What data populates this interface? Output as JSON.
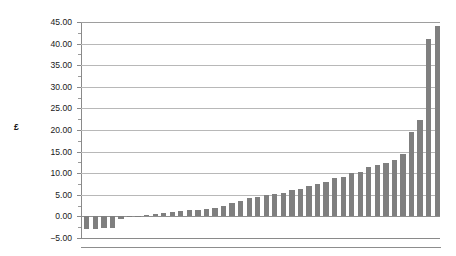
{
  "chart_data": {
    "type": "bar",
    "title": "",
    "subtitle": "",
    "xlabel": "",
    "ylabel": "£",
    "ylim": [
      -5,
      45
    ],
    "ytick_step": 5,
    "ytick_labels": [
      "45.00",
      "40.00",
      "35.00",
      "30.00",
      "25.00",
      "20.00",
      "15.00",
      "10.00",
      "5.00",
      "0.00",
      "−5.00"
    ],
    "ytick_values": [
      45,
      40,
      35,
      30,
      25,
      20,
      15,
      10,
      5,
      0,
      -5
    ],
    "grid": true,
    "legend": "none",
    "bar_color": "#7f7f7f",
    "sorted_ascending": true,
    "categories": [
      "1",
      "2",
      "3",
      "4",
      "5",
      "6",
      "7",
      "8",
      "9",
      "10",
      "11",
      "12",
      "13",
      "14",
      "15",
      "16",
      "17",
      "18",
      "19",
      "20",
      "21",
      "22",
      "23",
      "24",
      "25",
      "26",
      "27",
      "28",
      "29",
      "30",
      "31",
      "32",
      "33",
      "34",
      "35",
      "36",
      "37",
      "38",
      "39",
      "40",
      "41",
      "42"
    ],
    "values": [
      -3.0,
      -3.0,
      -2.6,
      -2.6,
      -0.5,
      -0.2,
      0.2,
      0.3,
      0.5,
      0.7,
      1.0,
      1.2,
      1.4,
      1.5,
      1.7,
      2.0,
      2.3,
      3.0,
      3.5,
      4.2,
      4.5,
      5.0,
      5.3,
      5.5,
      6.0,
      6.3,
      7.0,
      7.5,
      8.0,
      8.8,
      9.2,
      10.0,
      10.3,
      11.5,
      12.0,
      12.3,
      13.0,
      14.5,
      19.5,
      22.3,
      41.0,
      44.0
    ]
  },
  "axis": {
    "unit_label": "£"
  }
}
